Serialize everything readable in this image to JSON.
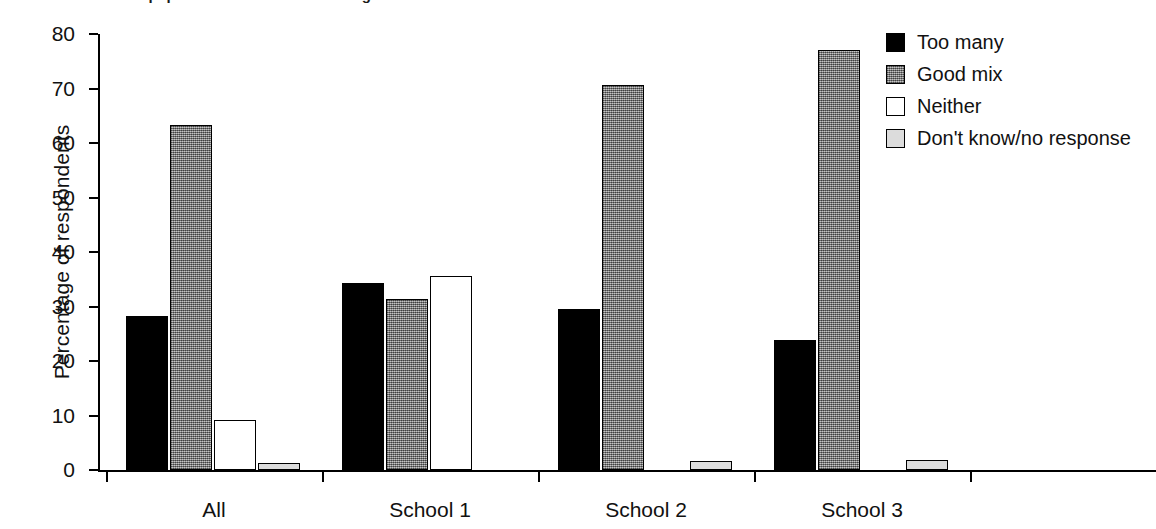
{
  "title": {
    "text": "attitudes of different pupils towards the mix of backgrounds at their school",
    "clipped": true
  },
  "chart_data": {
    "type": "bar",
    "title": "",
    "xlabel": "",
    "ylabel": "Percentage of respondents",
    "categories": [
      "All",
      "School 1",
      "School 2",
      "School 3"
    ],
    "ylim": [
      0,
      80
    ],
    "yticks": [
      0,
      10,
      20,
      30,
      40,
      50,
      60,
      70,
      80
    ],
    "grid": false,
    "legend_position": "top-right",
    "series": [
      {
        "name": "Too many",
        "color": "#000000",
        "fill": "solid-black",
        "values": [
          28.2,
          34.4,
          29.6,
          23.8
        ]
      },
      {
        "name": "Good mix",
        "color": "#8f8f8f",
        "fill": "gray-stipple",
        "values": [
          63.3,
          31.3,
          70.6,
          77.0
        ]
      },
      {
        "name": "Neither",
        "color": "#ffffff",
        "fill": "white-outline",
        "values": [
          9.2,
          35.6,
          0.0,
          0.0
        ]
      },
      {
        "name": "Don't know/no response",
        "color": "#dcdcdc",
        "fill": "light-gray",
        "values": [
          1.2,
          0.0,
          1.7,
          1.8
        ]
      }
    ]
  },
  "axis": {
    "y_title": "Percentage of respondents",
    "y_tick_labels": [
      "0",
      "10",
      "20",
      "30",
      "40",
      "50",
      "60",
      "70",
      "80"
    ],
    "x_tick_labels": [
      "All",
      "School 1",
      "School 2",
      "School 3"
    ]
  },
  "legend": {
    "items": [
      {
        "label": "Too many",
        "swatch": "solid-black"
      },
      {
        "label": "Good mix",
        "swatch": "gray-stipple"
      },
      {
        "label": "Neither",
        "swatch": "white-outline"
      },
      {
        "label": "Don't know/no response",
        "swatch": "light-gray"
      }
    ]
  }
}
